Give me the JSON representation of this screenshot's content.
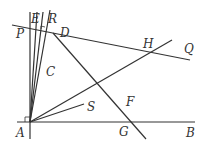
{
  "diagram": {
    "labels": {
      "P": "P",
      "E": "E",
      "R": "R",
      "D": "D",
      "H": "H",
      "Q": "Q",
      "C": "C",
      "F": "F",
      "S": "S",
      "A": "A",
      "G": "G",
      "B": "B"
    },
    "colors": {
      "stroke": "#333333",
      "background": "#ffffff"
    }
  }
}
